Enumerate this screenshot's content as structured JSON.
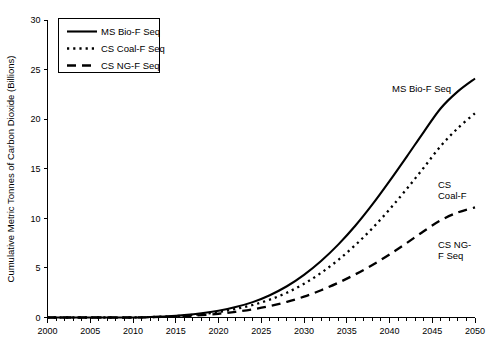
{
  "chart_data": {
    "type": "line",
    "title": "",
    "xlabel": "",
    "ylabel": "Cumulative Metric Tonnes of Carbon Dioxide (Billions)",
    "xlim": [
      2000,
      2050
    ],
    "ylim": [
      0,
      30
    ],
    "grid": false,
    "legend_position": "top-left",
    "x_ticks": [
      2000,
      2005,
      2010,
      2015,
      2020,
      2025,
      2030,
      2035,
      2040,
      2045,
      2050
    ],
    "x_tick_labels": [
      "2000",
      "2005",
      "2010",
      "2015",
      "2020",
      "2025",
      "2030",
      "2035",
      "2040",
      "2045",
      "2050"
    ],
    "x_minor_tick_step": 1,
    "y_ticks": [
      0,
      5,
      10,
      15,
      20,
      25,
      30
    ],
    "y_tick_labels": [
      "0",
      "5",
      "10",
      "15",
      "20",
      "25",
      "30"
    ],
    "x": [
      2000,
      2005,
      2010,
      2012,
      2014,
      2016,
      2018,
      2020,
      2022,
      2024,
      2026,
      2028,
      2030,
      2032,
      2034,
      2036,
      2038,
      2040,
      2042,
      2044,
      2046,
      2048,
      2050
    ],
    "series": [
      {
        "name": "MS Bio-F Seq",
        "style": "solid",
        "color": "#000000",
        "values": [
          0,
          0,
          0,
          0.05,
          0.12,
          0.24,
          0.42,
          0.68,
          1.05,
          1.55,
          2.25,
          3.15,
          4.3,
          5.7,
          7.35,
          9.25,
          11.4,
          13.75,
          16.2,
          18.7,
          21.1,
          22.8,
          24.1
        ]
      },
      {
        "name": "CS Coal-F Seq",
        "style": "dotted",
        "color": "#000000",
        "values": [
          0,
          0,
          0,
          0.04,
          0.1,
          0.2,
          0.35,
          0.56,
          0.86,
          1.26,
          1.8,
          2.5,
          3.4,
          4.5,
          5.8,
          7.3,
          9.0,
          10.9,
          12.95,
          15.1,
          17.3,
          19.1,
          20.6
        ]
      },
      {
        "name": "CS NG-F Seq",
        "style": "dashed",
        "color": "#000000",
        "values": [
          0,
          0,
          0,
          0.03,
          0.07,
          0.14,
          0.24,
          0.38,
          0.57,
          0.82,
          1.15,
          1.58,
          2.1,
          2.75,
          3.5,
          4.35,
          5.3,
          6.35,
          7.5,
          8.7,
          9.8,
          10.6,
          11.1
        ]
      }
    ],
    "legend": [
      {
        "label": "MS Bio-F Seq",
        "style": "solid"
      },
      {
        "label": "CS Coal-F Seq",
        "style": "dotted"
      },
      {
        "label": "CS NG-F Seq",
        "style": "dashed"
      }
    ],
    "annotations": [
      {
        "text": "MS Bio-F Seq",
        "x": 392,
        "y": 92
      },
      {
        "text": "CS",
        "x": 438,
        "y": 188
      },
      {
        "text": "Coal-F",
        "x": 438,
        "y": 199
      },
      {
        "text": "CS NG-",
        "x": 438,
        "y": 248
      },
      {
        "text": "F Seq",
        "x": 438,
        "y": 259
      }
    ]
  }
}
